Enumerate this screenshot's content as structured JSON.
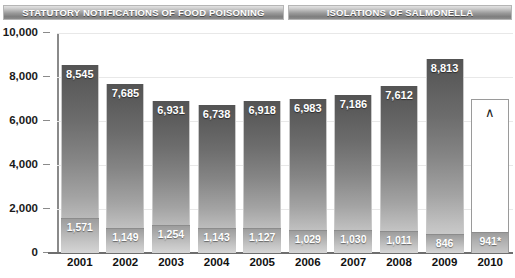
{
  "legend": {
    "food_poisoning": "STATUTORY NOTIFICATIONS OF FOOD POISONING",
    "salmonella": "ISOLATIONS OF SALMONELLA"
  },
  "marker": {
    "caret_symbol": "∧"
  },
  "chart_data": {
    "type": "bar",
    "title": "",
    "subtitle": "",
    "xlabel": "",
    "ylabel": "",
    "ylim": [
      0,
      10000
    ],
    "grid": true,
    "legend_position": "top",
    "categories": [
      "2001",
      "2002",
      "2003",
      "2004",
      "2005",
      "2006",
      "2007",
      "2008",
      "2009",
      "2010"
    ],
    "ticks": [
      "0",
      "2,000",
      "4,000",
      "6,000",
      "8,000",
      "10,000"
    ],
    "tick_values": [
      0,
      2000,
      4000,
      6000,
      8000,
      10000
    ],
    "series": [
      {
        "name": "STATUTORY NOTIFICATIONS OF FOOD POISONING",
        "values": [
          8545,
          7685,
          6931,
          6738,
          6918,
          6983,
          7186,
          7612,
          8813,
          null
        ],
        "labels": [
          "8,545",
          "7,685",
          "6,931",
          "6,738",
          "6,918",
          "6,983",
          "7,186",
          "7,612",
          "8,813",
          ""
        ]
      },
      {
        "name": "ISOLATIONS OF SALMONELLA",
        "values": [
          1571,
          1149,
          1254,
          1143,
          1127,
          1029,
          1030,
          1011,
          846,
          941
        ],
        "labels": [
          "1,571",
          "1,149",
          "1,254",
          "1,143",
          "1,127",
          "1,029",
          "1,030",
          "1,011",
          "846",
          "941*"
        ]
      }
    ],
    "annotations": [
      {
        "category": "2010",
        "symbol": "∧",
        "note": "food poisoning bar shown hollow / not available"
      },
      {
        "category": "2010",
        "symbol": "*",
        "note": "941* provisional"
      }
    ]
  }
}
